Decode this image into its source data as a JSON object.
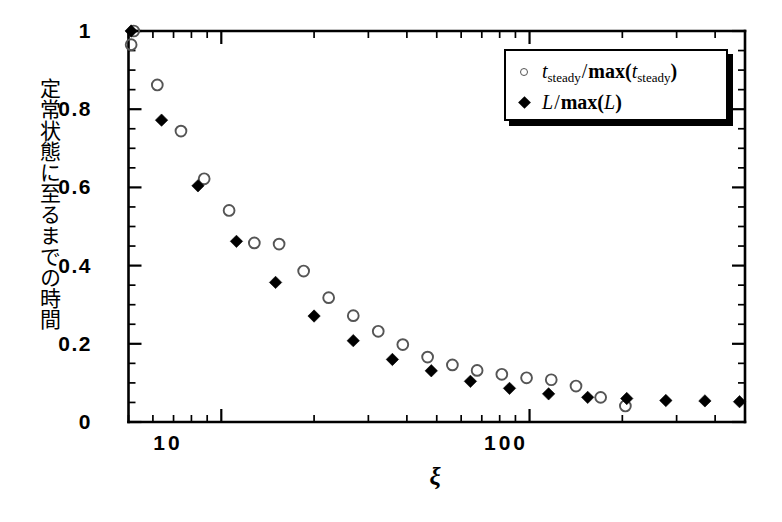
{
  "chart_data": {
    "type": "scatter",
    "title": "",
    "xlabel": "ξ",
    "ylabel": "定常状態に至るまでの時間",
    "xscale": "log",
    "yscale": "linear",
    "xlim": [
      5.0,
      500.0
    ],
    "ylim": [
      0.0,
      1.0
    ],
    "grid": false,
    "legend_position": "top-right",
    "xtick_labels": [
      "10",
      "100"
    ],
    "xtick_values": [
      10,
      100
    ],
    "ytick_labels": [
      "0",
      "0.2",
      "0.4",
      "0.6",
      "0.8",
      "1"
    ],
    "ytick_values": [
      0,
      0.2,
      0.4,
      0.6,
      0.8,
      1.0
    ],
    "y_minor_step": 0.05,
    "series": [
      {
        "name": "t_steady/max(t_steady)",
        "marker": "open-circle",
        "color": "#555555",
        "x": [
          5.1,
          5.2,
          6.2,
          7.4,
          8.8,
          10.6,
          12.8,
          15.4,
          18.5,
          22.3,
          26.8,
          32.3,
          38.8,
          46.7,
          56.2,
          67.6,
          81.3,
          97.8,
          117.6,
          141.5,
          170.1,
          204.6
        ],
        "y": [
          0.965,
          1.0,
          0.862,
          0.744,
          0.622,
          0.541,
          0.458,
          0.455,
          0.386,
          0.318,
          0.272,
          0.232,
          0.198,
          0.166,
          0.146,
          0.132,
          0.122,
          0.113,
          0.108,
          0.092,
          0.063,
          0.041
        ]
      },
      {
        "name": "L/max(L)",
        "marker": "filled-diamond",
        "color": "#000000",
        "x": [
          5.1,
          6.4,
          8.4,
          11.2,
          15.0,
          20.0,
          26.8,
          35.9,
          48.0,
          64.3,
          86.1,
          115.3,
          154.4,
          206.7,
          276.8,
          370.6,
          480.0
        ],
        "y": [
          1.0,
          0.772,
          0.604,
          0.462,
          0.357,
          0.271,
          0.208,
          0.16,
          0.131,
          0.104,
          0.086,
          0.072,
          0.063,
          0.06,
          0.055,
          0.054,
          0.052
        ]
      }
    ]
  },
  "legend": {
    "entries": [
      {
        "marker": "open-circle",
        "numerator_symbol": "t",
        "numerator_sub": "steady",
        "denominator_fn": "max",
        "denominator_symbol": "t",
        "denominator_sub": "steady"
      },
      {
        "marker": "filled-diamond",
        "numerator_symbol": "L",
        "numerator_sub": "",
        "denominator_fn": "max",
        "denominator_symbol": "L",
        "denominator_sub": ""
      }
    ]
  },
  "axes": {
    "x_title": "ξ",
    "y_title": "定常状態に至るまでの時間",
    "x_ticks": [
      {
        "label": "10",
        "value": 10
      },
      {
        "label": "100",
        "value": 100
      }
    ],
    "y_ticks": [
      {
        "label": "1",
        "value": 1.0
      },
      {
        "label": "0.8",
        "value": 0.8
      },
      {
        "label": "0.6",
        "value": 0.6
      },
      {
        "label": "0.4",
        "value": 0.4
      },
      {
        "label": "0.2",
        "value": 0.2
      },
      {
        "label": "0",
        "value": 0.0
      }
    ]
  },
  "colors": {
    "axis": "#000000",
    "marker_open": "#555555",
    "marker_filled": "#000000",
    "background": "#ffffff"
  }
}
